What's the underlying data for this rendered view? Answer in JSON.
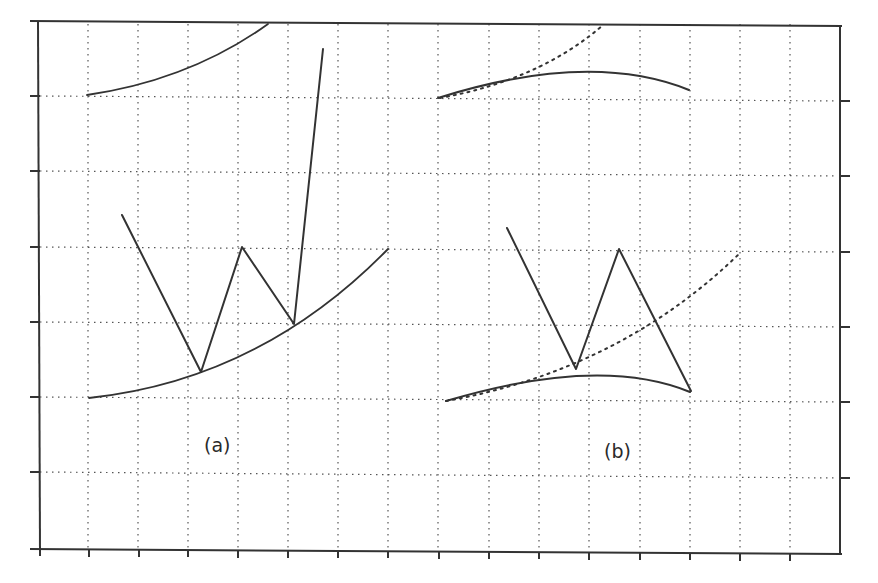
{
  "figure": {
    "panels": [
      {
        "id": "a",
        "label": "(a)",
        "description": "Zig-zag path bouncing off a convex (upward-curving) lower boundary, with an upper boundary arc; final segment shoots steeply upward"
      },
      {
        "id": "b",
        "label": "(b)",
        "description": "Zig-zag path reflecting off a concave (arched) lower boundary; dotted curves show the convex boundary from panel (a) for comparison"
      }
    ],
    "grid": {
      "style": "dotted",
      "vertical_lines_x": [
        88,
        138,
        188,
        238,
        288,
        338,
        388,
        438,
        488,
        538,
        588,
        638,
        688,
        738,
        788
      ],
      "horizontal_lines_y": [
        96,
        171,
        247,
        322,
        397,
        472
      ]
    },
    "axes": {
      "frame": {
        "left": 38,
        "top": 22,
        "right": 840,
        "bottom": 550
      },
      "tick_labels": []
    },
    "colors": {
      "line": "#333333",
      "grid": "#555555",
      "background": "#ffffff"
    }
  }
}
